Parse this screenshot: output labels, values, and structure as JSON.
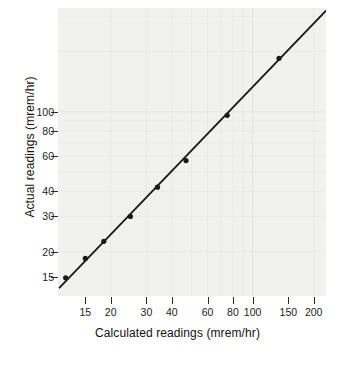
{
  "chart_data": {
    "type": "scatter",
    "title": "",
    "xlabel": "Calculated readings (mrem/hr)",
    "ylabel": "Actual readings (mrem/hr)",
    "xscale": "log",
    "yscale": "log",
    "grid": true,
    "legend": "none",
    "xlim": [
      11,
      230
    ],
    "ylim": [
      12,
      330
    ],
    "xticks": [
      15,
      20,
      30,
      40,
      60,
      80,
      100,
      150,
      200
    ],
    "xtick_labels": [
      "15",
      "20",
      "30",
      "40",
      "60",
      "80",
      "100",
      "150",
      "200"
    ],
    "yticks": [
      15,
      20,
      30,
      40,
      60,
      80,
      100
    ],
    "ytick_labels": [
      "15",
      "20",
      "30",
      "40",
      "60",
      "80",
      "100"
    ],
    "x": [
      12.0,
      15.0,
      18.5,
      25.0,
      34.0,
      47.0,
      75.0,
      135.0
    ],
    "y": [
      14.8,
      18.5,
      22.5,
      30.0,
      42.0,
      57.0,
      96.0,
      185.0
    ],
    "series": [
      {
        "name": "Measured points",
        "marker": "filled-circle",
        "color": "#1a1a1a",
        "x": [
          12.0,
          15.0,
          18.5,
          25.0,
          34.0,
          47.0,
          75.0,
          135.0
        ],
        "y": [
          14.8,
          18.5,
          22.5,
          30.0,
          42.0,
          57.0,
          96.0,
          185.0
        ]
      },
      {
        "name": "Fitted line",
        "type": "line",
        "color": "#1a1a1a",
        "x": [
          11.2,
          230.0
        ],
        "y": [
          13.2,
          320.0
        ]
      }
    ],
    "annotations": []
  },
  "axes": {
    "x_title": "Calculated readings (mrem/hr)",
    "y_title": "Actual readings (mrem/hr)"
  }
}
